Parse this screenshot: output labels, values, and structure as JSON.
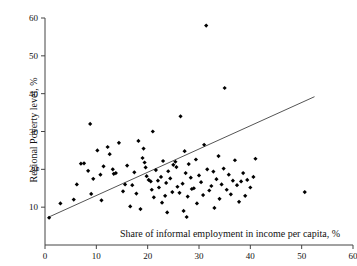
{
  "chart_data": {
    "type": "scatter",
    "title": "",
    "xlabel": "Share of informal employment in income per capita, %",
    "ylabel": "Regional Poverty level, %",
    "xlim": [
      0,
      60
    ],
    "ylim": [
      0,
      60
    ],
    "xticks": [
      0,
      10,
      20,
      30,
      40,
      50,
      60
    ],
    "yticks": [
      10,
      20,
      30,
      40,
      50,
      60
    ],
    "grid": false,
    "legend": null,
    "marker": "filled-diamond",
    "marker_color": "#000000",
    "trend_line": {
      "color": "#555555",
      "x_start": 0.6,
      "y_start": 7.3,
      "x_end": 52.5,
      "y_end": 39.2
    },
    "points": [
      [
        0.8,
        7.2
      ],
      [
        3.0,
        11.0
      ],
      [
        5.6,
        12.0
      ],
      [
        6.2,
        16.0
      ],
      [
        7.0,
        21.5
      ],
      [
        7.6,
        21.6
      ],
      [
        8.4,
        19.6
      ],
      [
        8.8,
        32.0
      ],
      [
        9.0,
        13.5
      ],
      [
        9.4,
        17.5
      ],
      [
        10.2,
        25.0
      ],
      [
        10.8,
        18.6
      ],
      [
        11.0,
        11.8
      ],
      [
        11.4,
        20.8
      ],
      [
        12.2,
        25.9
      ],
      [
        12.6,
        24.0
      ],
      [
        13.2,
        20.0
      ],
      [
        13.4,
        18.8
      ],
      [
        13.8,
        19.0
      ],
      [
        14.4,
        27.0
      ],
      [
        15.2,
        14.2
      ],
      [
        15.6,
        16.0
      ],
      [
        16.0,
        21.0
      ],
      [
        16.6,
        10.2
      ],
      [
        17.0,
        15.8
      ],
      [
        17.4,
        19.2
      ],
      [
        17.8,
        13.6
      ],
      [
        18.2,
        27.5
      ],
      [
        18.6,
        9.5
      ],
      [
        19.0,
        23.0
      ],
      [
        19.2,
        25.5
      ],
      [
        19.4,
        21.8
      ],
      [
        19.6,
        20.5
      ],
      [
        19.8,
        18.2
      ],
      [
        20.2,
        17.2
      ],
      [
        20.6,
        16.8
      ],
      [
        20.8,
        14.6
      ],
      [
        21.0,
        30.0
      ],
      [
        21.2,
        12.6
      ],
      [
        21.6,
        19.8
      ],
      [
        22.0,
        17.0
      ],
      [
        22.2,
        15.2
      ],
      [
        22.6,
        18.0
      ],
      [
        22.8,
        11.2
      ],
      [
        23.0,
        22.2
      ],
      [
        23.4,
        13.0
      ],
      [
        23.6,
        16.4
      ],
      [
        23.8,
        8.6
      ],
      [
        24.0,
        19.5
      ],
      [
        24.4,
        17.6
      ],
      [
        24.8,
        14.0
      ],
      [
        25.0,
        21.2
      ],
      [
        25.4,
        22.0
      ],
      [
        25.6,
        20.6
      ],
      [
        25.8,
        15.4
      ],
      [
        26.2,
        13.8
      ],
      [
        26.4,
        34.0
      ],
      [
        26.8,
        16.2
      ],
      [
        27.0,
        9.0
      ],
      [
        27.2,
        24.8
      ],
      [
        27.4,
        19.0
      ],
      [
        27.6,
        7.4
      ],
      [
        27.8,
        12.8
      ],
      [
        28.0,
        21.4
      ],
      [
        28.4,
        17.8
      ],
      [
        28.6,
        14.8
      ],
      [
        29.0,
        15.0
      ],
      [
        29.4,
        22.6
      ],
      [
        29.6,
        11.0
      ],
      [
        30.0,
        18.4
      ],
      [
        30.4,
        16.6
      ],
      [
        30.8,
        13.2
      ],
      [
        31.0,
        26.5
      ],
      [
        31.4,
        58.0
      ],
      [
        31.6,
        20.0
      ],
      [
        32.0,
        14.4
      ],
      [
        32.4,
        15.6
      ],
      [
        32.8,
        19.4
      ],
      [
        33.0,
        9.8
      ],
      [
        33.4,
        17.4
      ],
      [
        33.8,
        23.5
      ],
      [
        34.0,
        12.2
      ],
      [
        34.4,
        16.0
      ],
      [
        34.8,
        20.2
      ],
      [
        35.0,
        41.5
      ],
      [
        35.4,
        14.6
      ],
      [
        35.8,
        18.6
      ],
      [
        36.2,
        13.4
      ],
      [
        36.6,
        17.0
      ],
      [
        37.0,
        22.4
      ],
      [
        37.4,
        15.8
      ],
      [
        37.8,
        11.4
      ],
      [
        38.2,
        16.8
      ],
      [
        38.6,
        19.0
      ],
      [
        39.0,
        13.0
      ],
      [
        39.4,
        17.2
      ],
      [
        40.0,
        15.2
      ],
      [
        40.6,
        18.0
      ],
      [
        41.0,
        22.8
      ],
      [
        50.6,
        14.0
      ]
    ]
  }
}
